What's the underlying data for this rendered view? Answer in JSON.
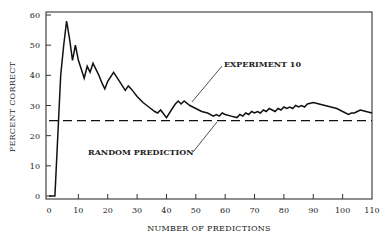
{
  "chart_data": {
    "type": "line",
    "title": "",
    "xlabel": "NUMBER OF PREDICTIONS",
    "ylabel": "PERCENT CORRECT",
    "xlim": [
      0,
      110
    ],
    "ylim": [
      0,
      60
    ],
    "x_ticks": [
      0,
      10,
      20,
      30,
      40,
      50,
      60,
      70,
      80,
      90,
      100,
      110
    ],
    "y_ticks": [
      0,
      10,
      20,
      30,
      40,
      50,
      60
    ],
    "grid": false,
    "legend": "none",
    "series": [
      {
        "name": "EXPERIMENT 10",
        "style": "solid",
        "x": [
          0,
          2,
          3,
          4,
          5,
          6,
          7,
          8,
          9,
          10,
          11,
          12,
          13,
          14,
          15,
          16,
          17,
          18,
          19,
          20,
          22,
          24,
          26,
          27,
          28,
          30,
          32,
          34,
          36,
          37,
          38,
          40,
          42,
          43,
          44,
          45,
          46,
          48,
          50,
          52,
          54,
          56,
          57,
          58,
          59,
          60,
          62,
          64,
          65,
          66,
          67,
          68,
          69,
          70,
          71,
          72,
          73,
          74,
          75,
          76,
          77,
          78,
          79,
          80,
          81,
          82,
          83,
          84,
          85,
          86,
          87,
          88,
          90,
          92,
          94,
          96,
          98,
          100,
          102,
          103,
          104,
          105,
          106,
          108,
          110
        ],
        "values": [
          0,
          0,
          20,
          40,
          50,
          58,
          52,
          45,
          50,
          45,
          42,
          39,
          43,
          41,
          44,
          42,
          40,
          37.5,
          35.5,
          38,
          41,
          38,
          35,
          36.5,
          35.5,
          33,
          31,
          29.5,
          28,
          27.5,
          28.5,
          26,
          29,
          30.5,
          31.5,
          30.5,
          31.5,
          30,
          29,
          28,
          27.5,
          26.5,
          27,
          26.5,
          27.5,
          27,
          26.5,
          26,
          27,
          26.5,
          27.5,
          27,
          28,
          27.5,
          28,
          27.5,
          28.5,
          28,
          29,
          28.5,
          28,
          29,
          28.5,
          29.5,
          29,
          29.5,
          29,
          30,
          29.5,
          30,
          29.5,
          30.5,
          31,
          30.5,
          30,
          29.5,
          29,
          28,
          27,
          27.5,
          27.5,
          28,
          28.5,
          28,
          27.5
        ]
      },
      {
        "name": "RANDOM PREDICTION",
        "style": "dashed",
        "x": [
          0,
          110
        ],
        "values": [
          25,
          25
        ]
      }
    ],
    "annotations": [
      {
        "text": "EXPERIMENT 10",
        "points_to_series": "EXPERIMENT 10",
        "at_x": 48,
        "at_y": 30.5
      },
      {
        "text": "RANDOM PREDICTION",
        "points_to_series": "RANDOM PREDICTION",
        "at_x": 57,
        "at_y": 25
      }
    ]
  },
  "labels": {
    "xlabel": "NUMBER OF PREDICTIONS",
    "ylabel": "PERCENT CORRECT",
    "annot_experiment": "EXPERIMENT 10",
    "annot_random": "RANDOM PREDICTION"
  }
}
